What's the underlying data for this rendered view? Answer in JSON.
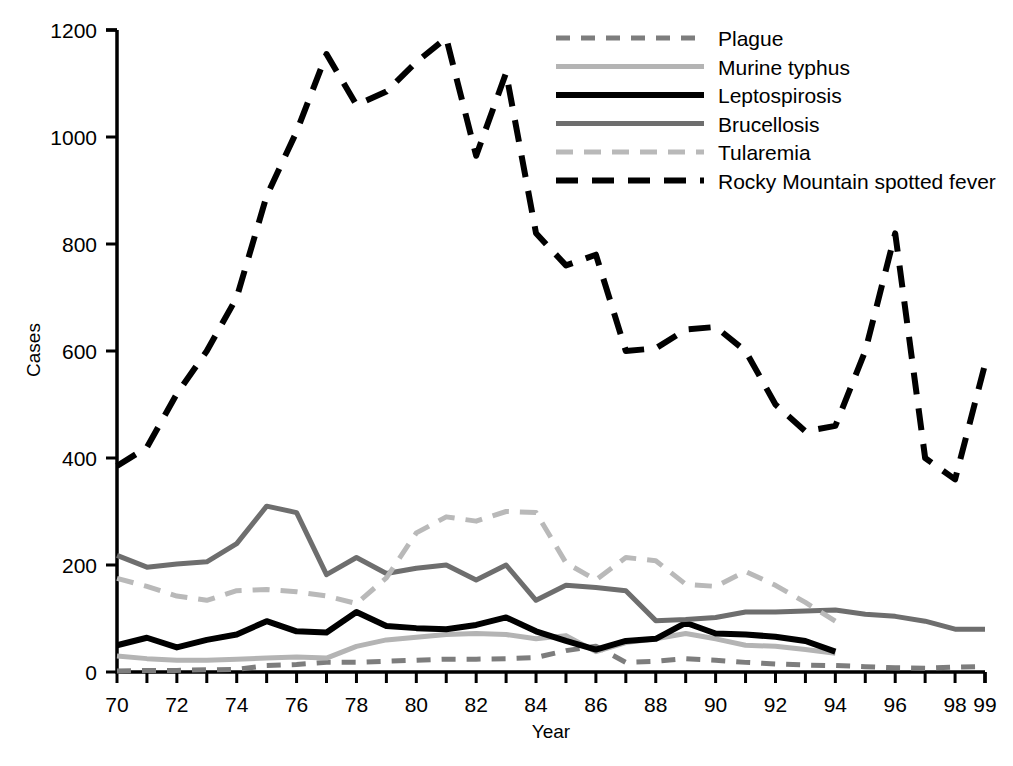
{
  "chart_data": {
    "type": "line",
    "title": "",
    "xlabel": "Year",
    "ylabel": "Cases",
    "xlim": [
      70,
      99
    ],
    "ylim": [
      0,
      1200
    ],
    "grid": false,
    "legend_position": "top-right",
    "x_tick_labels": [
      "70",
      "72",
      "74",
      "76",
      "78",
      "80",
      "82",
      "84",
      "86",
      "88",
      "90",
      "92",
      "94",
      "96",
      "98",
      "99"
    ],
    "x_tick_values": [
      70,
      72,
      74,
      76,
      78,
      80,
      82,
      84,
      86,
      88,
      90,
      92,
      94,
      96,
      98,
      99
    ],
    "y_tick_labels": [
      "0",
      "200",
      "400",
      "600",
      "800",
      "1000",
      "1200"
    ],
    "y_tick_values": [
      0,
      200,
      400,
      600,
      800,
      1000,
      1200
    ],
    "x": [
      70,
      71,
      72,
      73,
      74,
      75,
      76,
      77,
      78,
      79,
      80,
      81,
      82,
      83,
      84,
      85,
      86,
      87,
      88,
      89,
      90,
      91,
      92,
      93,
      94,
      95,
      96,
      97,
      98,
      99
    ],
    "series": [
      {
        "name": "Plague",
        "color": "#7d7d7d",
        "style": "dashed",
        "width": 5,
        "dash": "14,11",
        "x": [
          70,
          71,
          72,
          73,
          74,
          75,
          76,
          77,
          78,
          79,
          80,
          81,
          82,
          83,
          84,
          85,
          86,
          87,
          88,
          89,
          90,
          91,
          92,
          93,
          94,
          95,
          96,
          97,
          98,
          99
        ],
        "values": [
          2,
          3,
          3,
          4,
          5,
          12,
          14,
          18,
          18,
          20,
          22,
          24,
          24,
          25,
          27,
          40,
          48,
          18,
          20,
          25,
          22,
          18,
          15,
          13,
          12,
          10,
          8,
          7,
          9,
          10
        ]
      },
      {
        "name": "Murine typhus",
        "color": "#b4b4b4",
        "style": "solid",
        "width": 5,
        "dash": "none",
        "x": [
          70,
          71,
          72,
          73,
          74,
          75,
          76,
          77,
          78,
          79,
          80,
          81,
          82,
          83,
          84,
          85,
          86,
          87,
          88,
          89,
          90,
          91,
          92,
          93,
          94
        ],
        "values": [
          30,
          25,
          22,
          22,
          24,
          26,
          28,
          26,
          48,
          60,
          65,
          70,
          72,
          70,
          62,
          68,
          38,
          55,
          62,
          72,
          62,
          50,
          48,
          42,
          35
        ]
      },
      {
        "name": "Leptospirosis",
        "color": "#000000",
        "style": "solid",
        "width": 6,
        "dash": "none",
        "x": [
          70,
          71,
          72,
          73,
          74,
          75,
          76,
          77,
          78,
          79,
          80,
          81,
          82,
          83,
          84,
          85,
          86,
          87,
          88,
          89,
          90,
          91,
          92,
          93,
          94
        ],
        "values": [
          50,
          64,
          46,
          60,
          70,
          95,
          76,
          74,
          112,
          86,
          82,
          80,
          88,
          102,
          76,
          58,
          42,
          58,
          62,
          92,
          72,
          70,
          66,
          58,
          38
        ]
      },
      {
        "name": "Brucellosis",
        "color": "#6e6e6e",
        "style": "solid",
        "width": 5,
        "dash": "none",
        "x": [
          70,
          71,
          72,
          73,
          74,
          75,
          76,
          77,
          78,
          79,
          80,
          81,
          82,
          83,
          84,
          85,
          86,
          87,
          88,
          89,
          90,
          91,
          92,
          93,
          94,
          95,
          96,
          97,
          98,
          99
        ],
        "values": [
          218,
          196,
          202,
          206,
          240,
          310,
          298,
          182,
          214,
          184,
          194,
          200,
          172,
          200,
          134,
          162,
          158,
          152,
          96,
          98,
          102,
          112,
          112,
          114,
          116,
          108,
          104,
          95,
          80,
          80
        ]
      },
      {
        "name": "Tularemia",
        "color": "#b9b9b9",
        "style": "dashed",
        "width": 5,
        "dash": "17,11",
        "x": [
          70,
          71,
          72,
          73,
          74,
          75,
          76,
          77,
          78,
          79,
          80,
          81,
          82,
          83,
          84,
          85,
          86,
          87,
          88,
          89,
          90,
          91,
          92,
          93,
          94
        ],
        "values": [
          175,
          160,
          142,
          134,
          152,
          154,
          150,
          142,
          128,
          176,
          260,
          290,
          282,
          300,
          298,
          204,
          172,
          214,
          208,
          164,
          160,
          188,
          162,
          130,
          95
        ]
      },
      {
        "name": "Rocky Mountain spotted fever",
        "color": "#000000",
        "style": "dashed",
        "width": 6,
        "dash": "22,14",
        "x": [
          70,
          71,
          72,
          73,
          74,
          75,
          76,
          77,
          78,
          79,
          80,
          81,
          82,
          83,
          84,
          85,
          86,
          87,
          88,
          89,
          90,
          91,
          92,
          93,
          94,
          95,
          96,
          97,
          98,
          99
        ],
        "values": [
          385,
          420,
          520,
          600,
          700,
          890,
          1010,
          1155,
          1060,
          1085,
          1140,
          1185,
          965,
          1120,
          820,
          760,
          780,
          600,
          605,
          640,
          645,
          600,
          500,
          450,
          460,
          600,
          820,
          400,
          360,
          575
        ]
      }
    ]
  },
  "legend": {
    "entries": [
      {
        "label": "Plague"
      },
      {
        "label": "Murine typhus"
      },
      {
        "label": "Leptospirosis"
      },
      {
        "label": "Brucellosis"
      },
      {
        "label": "Tularemia"
      },
      {
        "label": "Rocky Mountain spotted fever"
      }
    ]
  },
  "axes": {
    "y_title": "Cases",
    "x_title": "Year"
  }
}
